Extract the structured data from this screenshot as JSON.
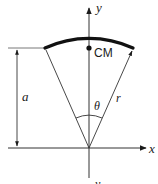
{
  "diagram": {
    "axis_labels": {
      "x": "x",
      "y": "y",
      "y_bottom": "y"
    },
    "labels": {
      "center_of_mass": "CM",
      "distance": "a",
      "angle": "θ",
      "radius": "r"
    },
    "colors": {
      "line": "#1a1a1a",
      "thin": "#333333"
    }
  }
}
